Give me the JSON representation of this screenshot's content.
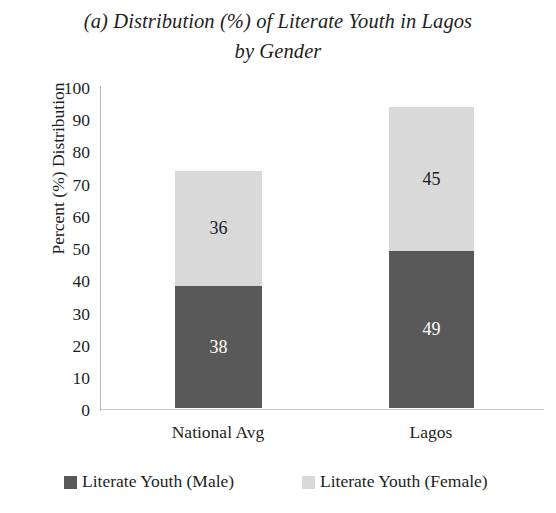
{
  "chart_data": {
    "type": "bar",
    "subtype": "stacked-column",
    "title": "(a) Distribution (%) of Literate Youth in Lagos by Gender",
    "title_lines": [
      "(a) Distribution (%) of Literate Youth in Lagos",
      "by Gender"
    ],
    "xlabel": "",
    "ylabel": "Percent (%) Distribution",
    "ylim": [
      0,
      100
    ],
    "ytick_labels": [
      "100",
      "90",
      "80",
      "70",
      "60",
      "50",
      "40",
      "30",
      "20",
      "10",
      "0"
    ],
    "ytick_values": [
      100,
      90,
      80,
      70,
      60,
      50,
      40,
      30,
      20,
      10,
      0
    ],
    "grid": false,
    "legend_position": "bottom",
    "categories": [
      "National Avg",
      "Lagos"
    ],
    "series": [
      {
        "name": "Literate Youth (Male)",
        "color": "#595959",
        "label_color": "#ffffff",
        "values": [
          38,
          49
        ]
      },
      {
        "name": "Literate Youth (Female)",
        "color": "#d9d9d9",
        "label_color": "#202020",
        "values": [
          36,
          45
        ]
      }
    ],
    "totals": [
      74,
      94
    ],
    "data_labels": {
      "national_avg_male": "38",
      "national_avg_female": "36",
      "lagos_male": "49",
      "lagos_female": "45"
    }
  }
}
